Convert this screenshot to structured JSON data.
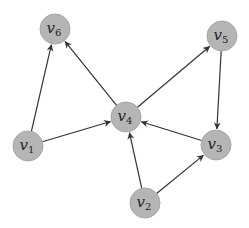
{
  "diagram": {
    "type": "directed-graph",
    "style": {
      "node_fill": "#b5b5b5",
      "node_stroke": "#a6a6a6",
      "edge_color": "#333333",
      "node_radius": 15,
      "background": "#ffffff"
    },
    "nodes": [
      {
        "id": "v1",
        "base": "v",
        "sub": "1",
        "x": 28,
        "y": 146
      },
      {
        "id": "v2",
        "base": "v",
        "sub": "2",
        "x": 145,
        "y": 203
      },
      {
        "id": "v3",
        "base": "v",
        "sub": "3",
        "x": 216,
        "y": 145
      },
      {
        "id": "v4",
        "base": "v",
        "sub": "4",
        "x": 126,
        "y": 117
      },
      {
        "id": "v5",
        "base": "v",
        "sub": "5",
        "x": 222,
        "y": 36
      },
      {
        "id": "v6",
        "base": "v",
        "sub": "6",
        "x": 55,
        "y": 29
      }
    ],
    "edges": [
      {
        "from": "v1",
        "to": "v6"
      },
      {
        "from": "v1",
        "to": "v4"
      },
      {
        "from": "v4",
        "to": "v6"
      },
      {
        "from": "v4",
        "to": "v5"
      },
      {
        "from": "v5",
        "to": "v3"
      },
      {
        "from": "v3",
        "to": "v4"
      },
      {
        "from": "v2",
        "to": "v4"
      },
      {
        "from": "v2",
        "to": "v3"
      }
    ]
  }
}
